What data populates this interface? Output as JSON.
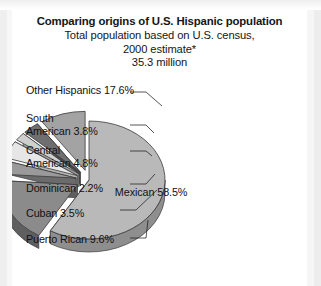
{
  "chart_data": {
    "type": "pie",
    "title": "Comparing origins of U.S. Hispanic population",
    "subtitle_lines": [
      "Total population based on U.S. census,",
      "2000 estimate*",
      "35.3 million"
    ],
    "total_label": "35.3 million",
    "units": "percent of total",
    "legend_position": "callout-labels",
    "categories": [
      "Mexican",
      "Other Hispanics",
      "South American",
      "Central American",
      "Dominican",
      "Cuban",
      "Puerto Rican"
    ],
    "values": [
      58.5,
      17.6,
      3.8,
      4.8,
      2.2,
      3.5,
      9.6
    ],
    "slices": [
      {
        "name": "Mexican",
        "value": 58.5,
        "label": "Mexican 58.5%",
        "color": "#b9b9b9",
        "side_color": "#8e8e8e",
        "exploded": false,
        "label_placement": "inside"
      },
      {
        "name": "Other Hispanics",
        "value": 17.6,
        "label": "Other Hispanics 17.6%",
        "color": "#8b8b8b",
        "side_color": "#5f5f5f",
        "exploded": true,
        "label_placement": "outside-left"
      },
      {
        "name": "South American",
        "value": 3.8,
        "label": "South\nAmerican 3.8%",
        "color": "#9a9a9a",
        "side_color": "#6b6b6b",
        "exploded": true,
        "label_placement": "outside-left"
      },
      {
        "name": "Central American",
        "value": 4.8,
        "label": "Central\nAmerican 4.8%",
        "color": "#e6e6e6",
        "side_color": "#b4b4b4",
        "exploded": true,
        "label_placement": "outside-left"
      },
      {
        "name": "Dominican",
        "value": 2.2,
        "label": "Dominican 2.2%",
        "color": "#cfcfcf",
        "side_color": "#9d9d9d",
        "exploded": true,
        "label_placement": "outside-left"
      },
      {
        "name": "Cuban",
        "value": 3.5,
        "label": "Cuban 3.5%",
        "color": "#6f6f6f",
        "side_color": "#4a4a4a",
        "exploded": true,
        "label_placement": "outside-left"
      },
      {
        "name": "Puerto Rican",
        "value": 9.6,
        "label": "Puerto Rican 9.6%",
        "color": "#a3a3a3",
        "side_color": "#757575",
        "exploded": true,
        "label_placement": "outside-left"
      }
    ],
    "footnote_marker": "*",
    "background": "#ffffff",
    "outline_color": "#3a3a3a"
  }
}
